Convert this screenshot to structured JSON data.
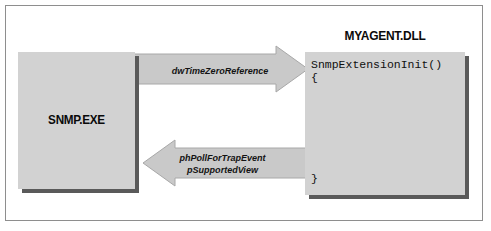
{
  "diagram": {
    "type": "sequence-interaction",
    "title_text": "",
    "colors": {
      "box_fill": "#d2d2d2",
      "box_shadow": "#5a5a5a",
      "arrow_fill": "#c9c9c9",
      "arrow_stroke": "#9a9a9a",
      "frame_border": "#8e8e8e",
      "text": "#0a0a0a",
      "page_background": "#ffffff"
    },
    "left_process": {
      "name": "snmp-exe",
      "label": "SNMP.EXE"
    },
    "right_module": {
      "name": "myagent-dll",
      "title": "MYAGENT.DLL",
      "code_lines": [
        "SnmpExtensionInit()",
        "{",
        "}"
      ],
      "signature": "SnmpExtensionInit()",
      "open_brace": "{",
      "close_brace": "}"
    },
    "arrows": [
      {
        "name": "arrow-call-to-dll",
        "direction": "right",
        "from": "SNMP.EXE",
        "to": "MYAGENT.DLL",
        "labels": [
          "dwTimeZeroReference"
        ]
      },
      {
        "name": "arrow-return-to-exe",
        "direction": "left",
        "from": "MYAGENT.DLL",
        "to": "SNMP.EXE",
        "labels": [
          "phPollForTrapEvent",
          "pSupportedView"
        ]
      }
    ],
    "label_call_param": "dwTimeZeroReference",
    "label_return_param_1": "phPollForTrapEvent",
    "label_return_param_2": "pSupportedView"
  }
}
